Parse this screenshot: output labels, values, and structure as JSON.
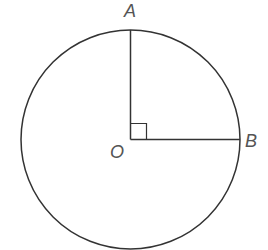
{
  "diagram": {
    "type": "geometry",
    "colors": {
      "stroke": "#333333",
      "label": "#555555",
      "background": "#ffffff"
    },
    "circle": {
      "center": {
        "x": 130.5,
        "y": 139.5
      },
      "radius": 109.5
    },
    "points": {
      "O": {
        "label": "O",
        "x": 130.5,
        "y": 139.5
      },
      "A": {
        "label": "A",
        "x": 130.5,
        "y": 30
      },
      "B": {
        "label": "B",
        "x": 240,
        "y": 139.5
      }
    },
    "segments": [
      {
        "from": "O",
        "to": "A"
      },
      {
        "from": "O",
        "to": "B"
      }
    ],
    "right_angle_marker": {
      "at": "O",
      "size": 16
    },
    "labels": {
      "A": "A",
      "B": "B",
      "O": "O"
    }
  }
}
